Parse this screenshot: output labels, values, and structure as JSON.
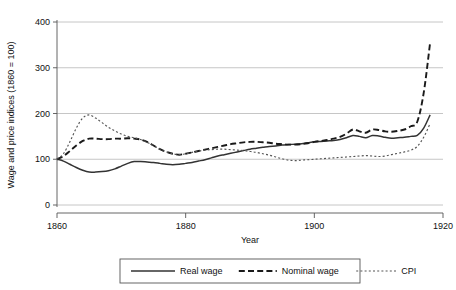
{
  "chart_data": {
    "type": "line",
    "title": "",
    "xlabel": "Year",
    "ylabel": "Wage and price indices (1860 = 100)",
    "xlim": [
      1860,
      1920
    ],
    "ylim": [
      0,
      400
    ],
    "xticks": [
      1860,
      1880,
      1900,
      1920
    ],
    "yticks": [
      0,
      100,
      200,
      300,
      400
    ],
    "xtick_labels": [
      "1860",
      "1880",
      "1900",
      "1920"
    ],
    "ytick_labels": [
      "0",
      "100",
      "200",
      "300",
      "400"
    ],
    "grid": "horizontal",
    "legend_position": "below-plot",
    "x": [
      1860,
      1861,
      1862,
      1863,
      1864,
      1865,
      1866,
      1867,
      1868,
      1869,
      1870,
      1871,
      1872,
      1873,
      1874,
      1875,
      1876,
      1877,
      1878,
      1879,
      1880,
      1881,
      1882,
      1883,
      1884,
      1885,
      1886,
      1887,
      1888,
      1889,
      1890,
      1891,
      1892,
      1893,
      1894,
      1895,
      1896,
      1897,
      1898,
      1899,
      1900,
      1901,
      1902,
      1903,
      1904,
      1905,
      1906,
      1907,
      1908,
      1909,
      1910,
      1911,
      1912,
      1913,
      1914,
      1915,
      1916,
      1917,
      1918
    ],
    "series": [
      {
        "name": "Real wage",
        "style": "solid",
        "color": "#333333",
        "values": [
          100,
          96,
          89,
          82,
          76,
          72,
          72,
          73,
          75,
          79,
          85,
          91,
          95,
          95,
          94,
          93,
          91,
          89,
          88,
          89,
          91,
          93,
          96,
          99,
          103,
          107,
          110,
          113,
          116,
          119,
          122,
          124,
          126,
          128,
          129,
          131,
          132,
          133,
          134,
          136,
          138,
          139,
          140,
          141,
          143,
          147,
          152,
          150,
          147,
          152,
          151,
          148,
          146,
          147,
          148,
          150,
          152,
          168,
          197
        ]
      },
      {
        "name": "Nominal wage",
        "style": "dashed",
        "color": "#1a1a1a",
        "values": [
          100,
          107,
          118,
          130,
          140,
          145,
          145,
          144,
          144,
          145,
          145,
          146,
          145,
          143,
          138,
          130,
          122,
          116,
          112,
          110,
          112,
          115,
          118,
          121,
          124,
          127,
          130,
          133,
          135,
          137,
          138,
          138,
          137,
          136,
          134,
          133,
          132,
          132,
          133,
          135,
          138,
          140,
          142,
          145,
          149,
          156,
          165,
          161,
          158,
          165,
          164,
          161,
          160,
          162,
          165,
          172,
          182,
          245,
          355
        ]
      },
      {
        "name": "CPI",
        "style": "dotted",
        "color": "#555555",
        "values": [
          100,
          112,
          138,
          168,
          190,
          197,
          190,
          180,
          170,
          162,
          155,
          150,
          147,
          143,
          137,
          130,
          122,
          116,
          112,
          110,
          112,
          115,
          118,
          120,
          121,
          122,
          122,
          121,
          120,
          119,
          117,
          115,
          112,
          109,
          105,
          101,
          98,
          97,
          98,
          99,
          100,
          101,
          102,
          103,
          104,
          105,
          106,
          107,
          108,
          107,
          106,
          107,
          110,
          113,
          116,
          120,
          128,
          148,
          178
        ]
      }
    ],
    "annotations": {
      "cpi_peak_year": 1865,
      "cpi_peak_value": 197,
      "real_wage_trough_year": 1865,
      "real_wage_trough_value": 72,
      "nominal_wage_end_value": 355
    }
  },
  "legend": {
    "items": [
      {
        "label": "Real wage"
      },
      {
        "label": "Nominal wage"
      },
      {
        "label": "CPI"
      }
    ]
  }
}
